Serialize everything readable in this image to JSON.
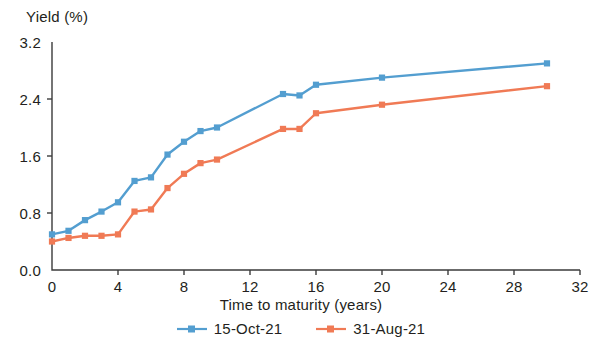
{
  "chart_data": {
    "type": "line",
    "title": "",
    "xlabel": "Time to maturity (years)",
    "ylabel": "Yield (%)",
    "xlim": [
      0,
      32
    ],
    "ylim": [
      0.0,
      3.2
    ],
    "xticks": [
      "0",
      "4",
      "8",
      "12",
      "16",
      "20",
      "24",
      "28",
      "32"
    ],
    "xtick_values": [
      0,
      4,
      8,
      12,
      16,
      20,
      24,
      28,
      32
    ],
    "yticks": [
      "0.0",
      "0.8",
      "1.6",
      "2.4",
      "3.2"
    ],
    "ytick_values": [
      0.0,
      0.8,
      1.6,
      2.4,
      3.2
    ],
    "grid": false,
    "legend_position": "bottom",
    "x": [
      0,
      1,
      2,
      3,
      4,
      5,
      6,
      7,
      8,
      9,
      10,
      14,
      15,
      16,
      20,
      30
    ],
    "series": [
      {
        "name": "15-Oct-21",
        "color": "#539ed0",
        "marker": "square",
        "values": [
          0.5,
          0.55,
          0.7,
          0.82,
          0.95,
          1.25,
          1.3,
          1.62,
          1.8,
          1.95,
          2.0,
          2.47,
          2.45,
          2.6,
          2.7,
          2.9
        ]
      },
      {
        "name": "31-Aug-21",
        "color": "#f07a55",
        "marker": "square",
        "values": [
          0.4,
          0.45,
          0.48,
          0.48,
          0.5,
          0.82,
          0.85,
          1.15,
          1.35,
          1.5,
          1.55,
          1.98,
          1.98,
          2.2,
          2.32,
          2.58
        ]
      }
    ]
  },
  "axis": {
    "y_title": "Yield (%)",
    "x_title": "Time to maturity (years)"
  },
  "legend": {
    "items": [
      {
        "label": "15-Oct-21",
        "color": "#539ed0"
      },
      {
        "label": "31-Aug-21",
        "color": "#f07a55"
      }
    ]
  },
  "colors": {
    "series_blue": "#539ed0",
    "series_orange": "#f07a55",
    "axis": "#3b3b3b",
    "text": "#231f20"
  }
}
